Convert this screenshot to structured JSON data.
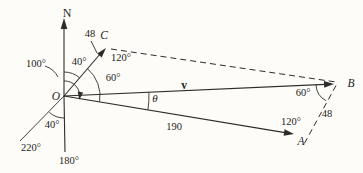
{
  "colors": {
    "ink": "#2e2c2a",
    "background": "#fdfcf9"
  },
  "labels": {
    "north": "N",
    "origin": "O",
    "point_a": "A",
    "point_b": "B",
    "point_c": "C",
    "vector_v": "v",
    "theta": "θ",
    "oc_magnitude": "48",
    "ab_magnitude": "48",
    "oa_magnitude": "190",
    "bearing_oc": "40°",
    "bearing_oa": "100°",
    "angle_at_o": "60°",
    "angle_at_c": "120°",
    "angle_at_a": "120°",
    "angle_at_b": "60°",
    "bearing_south": "180°",
    "bearing_southwest": "220°",
    "angle_south_to_sw": "40°"
  }
}
